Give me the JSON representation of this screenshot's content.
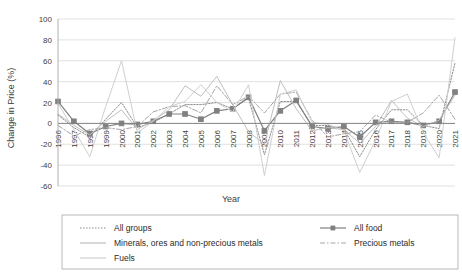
{
  "chart_data": {
    "type": "line",
    "title": "",
    "xlabel": "Year",
    "ylabel": "Change in Price (%)",
    "ylim": [
      -60,
      100
    ],
    "yticks": [
      -60,
      -40,
      -20,
      0,
      20,
      40,
      60,
      80,
      100
    ],
    "ytick_labels": [
      "-60",
      "-40",
      "-20",
      "0",
      "20",
      "40",
      "60",
      "80",
      "100"
    ],
    "grid": true,
    "legend_position": "bottom",
    "categories": [
      "1996",
      "1997",
      "1998",
      "1999",
      "2000",
      "2001",
      "2002",
      "2003",
      "2004",
      "2005",
      "2006",
      "2007",
      "2008",
      "2009",
      "2010",
      "2011",
      "2012",
      "2013",
      "2014",
      "2015",
      "2016",
      "2017",
      "2018",
      "2019",
      "2020",
      "2021"
    ],
    "series": [
      {
        "name": "All groups",
        "style": "dotted",
        "color": "#8c8c8c",
        "marker": "none",
        "values": [
          8,
          -4,
          -13,
          4,
          20,
          -4,
          1,
          9,
          18,
          18,
          20,
          14,
          24,
          -30,
          21,
          21,
          -2,
          -2,
          -5,
          -32,
          -6,
          13,
          13,
          -2,
          -5,
          58
        ]
      },
      {
        "name": "All food",
        "style": "solid",
        "color": "#808080",
        "marker": "square",
        "values": [
          21,
          2,
          -10,
          -3,
          0,
          -1,
          2,
          9,
          9,
          4,
          12,
          14,
          25,
          -7,
          12,
          22,
          -3,
          -5,
          -3,
          -13,
          1,
          2,
          1,
          -2,
          2,
          30
        ]
      },
      {
        "name": "Minerals, ores and non-precious metals",
        "style": "solid-light",
        "color": "#bfbfbf",
        "marker": "none",
        "values": [
          9,
          -2,
          -11,
          2,
          13,
          -6,
          3,
          13,
          36,
          26,
          45,
          18,
          -8,
          -20,
          41,
          14,
          -7,
          -4,
          -6,
          -19,
          -3,
          22,
          5,
          -3,
          3,
          27
        ]
      },
      {
        "name": "Precious metals",
        "style": "dashdot",
        "color": "#a6a6a6",
        "marker": "none",
        "values": [
          -2,
          -12,
          -6,
          -4,
          -6,
          -3,
          11,
          16,
          17,
          10,
          36,
          18,
          26,
          10,
          28,
          30,
          3,
          -13,
          -10,
          -8,
          8,
          1,
          1,
          10,
          27,
          4
        ]
      },
      {
        "name": "Fuels",
        "style": "solid-pale",
        "color": "#cfcfcf",
        "marker": "none",
        "values": [
          19,
          -6,
          -32,
          16,
          60,
          -9,
          2,
          16,
          21,
          37,
          20,
          11,
          37,
          -50,
          28,
          32,
          1,
          -1,
          -7,
          -47,
          -16,
          21,
          28,
          -9,
          -33,
          82
        ]
      }
    ],
    "legend_entries": [
      {
        "label": "All groups",
        "style": "dotted",
        "color": "#8c8c8c",
        "marker": "none"
      },
      {
        "label": "All food",
        "style": "solid",
        "color": "#808080",
        "marker": "square"
      },
      {
        "label": "Minerals, ores and non-precious metals",
        "style": "solid-light",
        "color": "#bfbfbf",
        "marker": "none"
      },
      {
        "label": "Precious metals",
        "style": "dashdot",
        "color": "#a6a6a6",
        "marker": "none"
      },
      {
        "label": "Fuels",
        "style": "solid-pale",
        "color": "#cfcfcf",
        "marker": "none"
      }
    ]
  }
}
